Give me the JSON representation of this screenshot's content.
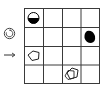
{
  "puzzle": {
    "rows": 4,
    "cols": 4,
    "line_color": "#3a3a3a",
    "cells": [
      {
        "row": 0,
        "col": 0,
        "shape": "half-filled-circle",
        "fill": "#000000"
      },
      {
        "row": 1,
        "col": 3,
        "shape": "filled-blob",
        "fill": "#000000"
      },
      {
        "row": 2,
        "col": 0,
        "shape": "outline-pentagon",
        "fill": "none"
      },
      {
        "row": 3,
        "col": 2,
        "shape": "outline-double-pentagon",
        "fill": "none"
      }
    ]
  },
  "side_icons": {
    "rotate": "rotate-icon",
    "arrow": "right-arrow-icon"
  }
}
